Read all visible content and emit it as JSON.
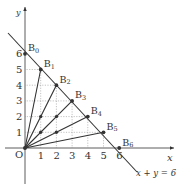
{
  "diagram": {
    "type": "coordinate-plane",
    "origin_label": "O",
    "x_axis_label": "x",
    "y_axis_label": "y",
    "line_label": "x + y = 6",
    "x_ticks": [
      "1",
      "2",
      "3",
      "4",
      "5",
      "6"
    ],
    "y_ticks": [
      "1",
      "2",
      "3",
      "4",
      "5",
      "6"
    ],
    "points": [
      {
        "name": "B",
        "sub": "0",
        "x": 0,
        "y": 6
      },
      {
        "name": "B",
        "sub": "1",
        "x": 1,
        "y": 5
      },
      {
        "name": "B",
        "sub": "2",
        "x": 2,
        "y": 4
      },
      {
        "name": "B",
        "sub": "3",
        "x": 3,
        "y": 3
      },
      {
        "name": "B",
        "sub": "4",
        "x": 4,
        "y": 2
      },
      {
        "name": "B",
        "sub": "5",
        "x": 5,
        "y": 1
      },
      {
        "name": "B",
        "sub": "6",
        "x": 6,
        "y": 0
      }
    ],
    "interior_points": [
      {
        "x": 1,
        "y": 1
      },
      {
        "x": 2,
        "y": 1
      },
      {
        "x": 1,
        "y": 2
      },
      {
        "x": 2,
        "y": 2
      }
    ],
    "segments_from_origin_to": [
      "B1",
      "B2",
      "B3",
      "B4",
      "B5"
    ],
    "colors": {
      "ink": "#333333",
      "grid": "#999999"
    }
  }
}
